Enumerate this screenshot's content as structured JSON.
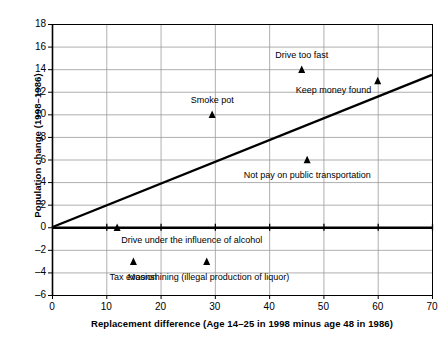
{
  "chart_data": {
    "type": "scatter",
    "title": "",
    "xlabel": "Replacement difference (Age 14–25 in 1998 minus age 48 in 1986)",
    "ylabel": "Population change (1998–1986)",
    "xlim": [
      0,
      70
    ],
    "ylim": [
      -6,
      18
    ],
    "xticks": [
      0,
      10,
      20,
      30,
      40,
      50,
      60,
      70
    ],
    "yticks": [
      -6,
      -4,
      -2,
      0,
      2,
      4,
      6,
      8,
      10,
      12,
      14,
      16,
      18
    ],
    "xtick_labels": [
      "0",
      "10",
      "20",
      "30",
      "40",
      "50",
      "60",
      "70"
    ],
    "ytick_labels": [
      "18",
      "16",
      "14",
      "12",
      "10",
      "8",
      "6",
      "4",
      "2",
      "0",
      "–2",
      "–4",
      "–6"
    ],
    "grid": true,
    "grid_color": "#9a9a9a",
    "marker": "triangle",
    "marker_color": "#000000",
    "points": [
      {
        "label": "Drive under the influence of alcohol",
        "x": 12,
        "y": 0,
        "label_dx": 4,
        "label_dy": 13,
        "label_align": "left"
      },
      {
        "label": "Tax evasion",
        "x": 15,
        "y": -3,
        "label_dx": 0,
        "label_dy": 16,
        "label_align": "center"
      },
      {
        "label": "Moonshining (illegal production of liquor)",
        "x": 28.5,
        "y": -3,
        "label_dx": 2,
        "label_dy": 16,
        "label_align": "center"
      },
      {
        "label": "Smoke pot",
        "x": 29.5,
        "y": 10,
        "label_dx": 0,
        "label_dy": -14,
        "label_align": "center"
      },
      {
        "label": "Drive too fast",
        "x": 46,
        "y": 14,
        "label_dx": 0,
        "label_dy": -14,
        "label_align": "center"
      },
      {
        "label": "Keep money found",
        "x": 60,
        "y": 13,
        "label_dx": -44,
        "label_dy": 10,
        "label_align": "center"
      },
      {
        "label": "Not pay on public transportation",
        "x": 47,
        "y": 6,
        "label_dx": 0,
        "label_dy": 15,
        "label_align": "center"
      }
    ],
    "trendline": {
      "name": "regression line",
      "x": [
        0,
        70
      ],
      "y": [
        0,
        13.5
      ],
      "color": "#000000",
      "width": 2.4
    },
    "zero_line": {
      "name": "zero axis line",
      "y": 0,
      "color": "#000000",
      "width": 2.4
    },
    "axis_color": "#000000",
    "background": "#ffffff"
  }
}
